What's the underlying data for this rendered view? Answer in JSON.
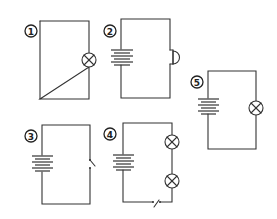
{
  "diagram": {
    "title": "",
    "circuits": [
      {
        "id": 1,
        "label": "1",
        "components": [
          "lamp"
        ]
      },
      {
        "id": 2,
        "label": "2",
        "components": [
          "battery",
          "bell"
        ]
      },
      {
        "id": 3,
        "label": "3",
        "components": [
          "battery",
          "open-switch"
        ]
      },
      {
        "id": 4,
        "label": "4",
        "components": [
          "battery",
          "lamp",
          "lamp",
          "open-switch"
        ]
      },
      {
        "id": 5,
        "label": "5",
        "components": [
          "battery",
          "lamp"
        ]
      }
    ],
    "colors": {
      "line": "#333333",
      "background": "#ffffff"
    }
  }
}
